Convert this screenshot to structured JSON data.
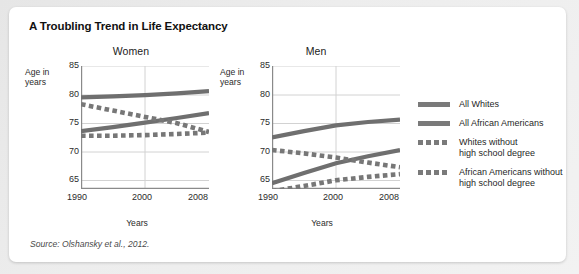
{
  "title": "A Troubling Trend in Life Expectancy",
  "source": "Source: Olshansky et al., 2012.",
  "legend": {
    "items": [
      {
        "label": "All Whites",
        "style": "solid",
        "color": "#7a7a7a"
      },
      {
        "label": "All African Americans",
        "style": "solid",
        "color": "#7a7a7a"
      },
      {
        "label": "Whites without\nhigh school degree",
        "style": "dashed",
        "color": "#7a7a7a"
      },
      {
        "label": "African Americans without\nhigh school degree",
        "style": "dashed",
        "color": "#7a7a7a"
      }
    ]
  },
  "panels": {
    "women": {
      "title": "Women",
      "y_caption": "Age in\nyears",
      "x_caption": "Years",
      "yticks": [
        "85",
        "80",
        "75",
        "70",
        "65"
      ],
      "xticks": [
        "1990",
        "2000",
        "2008"
      ]
    },
    "men": {
      "title": "Men",
      "y_caption": "Age in\nyears",
      "x_caption": "Years",
      "yticks": [
        "85",
        "80",
        "75",
        "70",
        "65"
      ],
      "xticks": [
        "1990",
        "2000",
        "2008"
      ]
    }
  },
  "chart_data": [
    {
      "type": "line",
      "title": "Women",
      "xlabel": "Years",
      "ylabel": "Age in years",
      "xlim": [
        1990,
        2008
      ],
      "ylim": [
        63,
        85
      ],
      "yticks": [
        65,
        70,
        75,
        80,
        85
      ],
      "xticks": [
        1990,
        2000,
        2008
      ],
      "grid": "horizontal-and-vertical-light",
      "legend_position": "right-outside",
      "x": [
        1990,
        1995,
        2000,
        2004,
        2008
      ],
      "series": [
        {
          "name": "All Whites",
          "style": "solid",
          "color": "#7a7a7a",
          "values": [
            79.5,
            79.7,
            79.9,
            80.2,
            80.6
          ]
        },
        {
          "name": "All African Americans",
          "style": "solid",
          "color": "#7a7a7a",
          "values": [
            73.6,
            74.3,
            75.1,
            75.9,
            76.6
          ]
        },
        {
          "name": "Whites without high school degree",
          "style": "dashed",
          "color": "#7a7a7a",
          "values": [
            78.3,
            77.2,
            76.1,
            75.0,
            73.5
          ]
        },
        {
          "name": "African Americans without high school degree",
          "style": "dashed",
          "color": "#7a7a7a",
          "values": [
            72.8,
            72.8,
            72.9,
            73.1,
            73.4
          ]
        }
      ]
    },
    {
      "type": "line",
      "title": "Men",
      "xlabel": "Years",
      "ylabel": "Age in years",
      "xlim": [
        1990,
        2008
      ],
      "ylim": [
        63,
        85
      ],
      "yticks": [
        65,
        70,
        75,
        80,
        85
      ],
      "xticks": [
        1990,
        2000,
        2008
      ],
      "grid": "horizontal-and-vertical-light",
      "legend_position": "right-outside",
      "x": [
        1990,
        1995,
        2000,
        2004,
        2008
      ],
      "series": [
        {
          "name": "All Whites",
          "style": "solid",
          "color": "#7a7a7a",
          "values": [
            72.5,
            73.6,
            74.6,
            75.2,
            75.6
          ]
        },
        {
          "name": "All African Americans",
          "style": "solid",
          "color": "#7a7a7a",
          "values": [
            64.4,
            66.2,
            67.9,
            69.1,
            70.2
          ]
        },
        {
          "name": "Whites without high school degree",
          "style": "dashed",
          "color": "#7a7a7a",
          "values": [
            70.3,
            69.7,
            69.0,
            68.1,
            67.3
          ]
        },
        {
          "name": "African Americans without high school degree",
          "style": "dashed",
          "color": "#7a7a7a",
          "values": [
            63.0,
            63.9,
            64.9,
            65.5,
            66.0
          ]
        }
      ]
    }
  ]
}
